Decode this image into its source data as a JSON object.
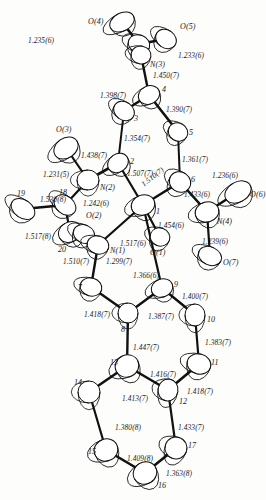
{
  "figure": {
    "type": "ortep-molecular-structure-diagram",
    "title": "",
    "background_color": "#fdfdfc",
    "line_color": "#111111"
  },
  "atoms": [
    {
      "id": "O4",
      "label": "O(4)",
      "x": 122,
      "y": 22,
      "rx": 13,
      "ry": 9,
      "rot": -28,
      "label_dx": -34,
      "label_dy": -4
    },
    {
      "id": "C21",
      "label": "",
      "x": 139,
      "y": 44,
      "rx": 11,
      "ry": 9,
      "rot": 20,
      "label_dx": 0,
      "label_dy": 0
    },
    {
      "id": "O5",
      "label": "O(5)",
      "x": 166,
      "y": 39,
      "rx": 11,
      "ry": 9,
      "rot": 35,
      "label_dx": 14,
      "label_dy": -16
    },
    {
      "id": "N3",
      "label": "N(3)",
      "x": 141,
      "y": 55,
      "rx": 10,
      "ry": 9,
      "rot": 10,
      "label_dx": 9,
      "label_dy": 6
    },
    {
      "id": "C4",
      "label": "4",
      "x": 149,
      "y": 95,
      "rx": 11,
      "ry": 9,
      "rot": -25,
      "label_dx": 13,
      "label_dy": -9
    },
    {
      "id": "C3",
      "label": "3",
      "x": 124,
      "y": 111,
      "rx": 11,
      "ry": 9,
      "rot": 35,
      "label_dx": 10,
      "label_dy": 4
    },
    {
      "id": "C5",
      "label": "5",
      "x": 178,
      "y": 132,
      "rx": 10,
      "ry": 9,
      "rot": 30,
      "label_dx": 11,
      "label_dy": -3
    },
    {
      "id": "C2",
      "label": "2",
      "x": 118,
      "y": 163,
      "rx": 11,
      "ry": 9,
      "rot": -35,
      "label_dx": 12,
      "label_dy": -5
    },
    {
      "id": "O3",
      "label": "O(3)",
      "x": 66,
      "y": 148,
      "rx": 13,
      "ry": 10,
      "rot": -35,
      "label_dx": -10,
      "label_dy": -22
    },
    {
      "id": "N2",
      "label": "N(2)",
      "x": 88,
      "y": 180,
      "rx": 11,
      "ry": 10,
      "rot": 0,
      "label_dx": 12,
      "label_dy": 4
    },
    {
      "id": "C6",
      "label": "6",
      "x": 180,
      "y": 182,
      "rx": 11,
      "ry": 10,
      "rot": 35,
      "label_dx": 11,
      "label_dy": -6
    },
    {
      "id": "C1",
      "label": "1",
      "x": 143,
      "y": 205,
      "rx": 12,
      "ry": 10,
      "rot": -20,
      "label_dx": 13,
      "label_dy": 3
    },
    {
      "id": "C18",
      "label": "18",
      "x": 65,
      "y": 205,
      "rx": 12,
      "ry": 9,
      "rot": 40,
      "label_dx": -6,
      "label_dy": -16
    },
    {
      "id": "C19",
      "label": "19",
      "x": 23,
      "y": 209,
      "rx": 13,
      "ry": 9,
      "rot": 35,
      "label_dx": -6,
      "label_dy": -19
    },
    {
      "id": "C20",
      "label": "20",
      "x": 70,
      "y": 232,
      "rx": 12,
      "ry": 10,
      "rot": -30,
      "label_dx": -12,
      "label_dy": 14
    },
    {
      "id": "O2",
      "label": "O(2)",
      "x": 84,
      "y": 234,
      "rx": 11,
      "ry": 9,
      "rot": 25,
      "label_dx": 2,
      "label_dy": -22
    },
    {
      "id": "N1",
      "label": "N(1)",
      "x": 98,
      "y": 245,
      "rx": 11,
      "ry": 9,
      "rot": 15,
      "label_dx": 12,
      "label_dy": 2
    },
    {
      "id": "O1",
      "label": "O(1)",
      "x": 160,
      "y": 237,
      "rx": 10,
      "ry": 9,
      "rot": 20,
      "label_dx": -10,
      "label_dy": 12
    },
    {
      "id": "N4",
      "label": "N(4)",
      "x": 207,
      "y": 212,
      "rx": 12,
      "ry": 10,
      "rot": -15,
      "label_dx": 10,
      "label_dy": 6
    },
    {
      "id": "O6",
      "label": "O(6)",
      "x": 238,
      "y": 192,
      "rx": 14,
      "ry": 10,
      "rot": -30,
      "label_dx": 12,
      "label_dy": -1
    },
    {
      "id": "O7",
      "label": "O(7)",
      "x": 210,
      "y": 256,
      "rx": 12,
      "ry": 9,
      "rot": 25,
      "label_dx": 13,
      "label_dy": 3
    },
    {
      "id": "C7",
      "label": "7",
      "x": 91,
      "y": 287,
      "rx": 11,
      "ry": 9,
      "rot": 15,
      "label_dx": -13,
      "label_dy": -3
    },
    {
      "id": "C9",
      "label": "9",
      "x": 162,
      "y": 288,
      "rx": 11,
      "ry": 9,
      "rot": -20,
      "label_dx": 12,
      "label_dy": -7
    },
    {
      "id": "C8",
      "label": "8",
      "x": 128,
      "y": 313,
      "rx": 10,
      "ry": 10,
      "rot": 0,
      "label_dx": -7,
      "label_dy": 13
    },
    {
      "id": "C10",
      "label": "10",
      "x": 195,
      "y": 315,
      "rx": 10,
      "ry": 11,
      "rot": 0,
      "label_dx": 12,
      "label_dy": 1
    },
    {
      "id": "C13",
      "label": "13",
      "x": 127,
      "y": 366,
      "rx": 12,
      "ry": 11,
      "rot": -25,
      "label_dx": -17,
      "label_dy": -7
    },
    {
      "id": "C11",
      "label": "11",
      "x": 199,
      "y": 364,
      "rx": 12,
      "ry": 10,
      "rot": 15,
      "label_dx": 12,
      "label_dy": -5
    },
    {
      "id": "C14",
      "label": "14",
      "x": 89,
      "y": 392,
      "rx": 11,
      "ry": 11,
      "rot": 0,
      "label_dx": -15,
      "label_dy": -13
    },
    {
      "id": "C12",
      "label": "12",
      "x": 168,
      "y": 390,
      "rx": 10,
      "ry": 11,
      "rot": 10,
      "label_dx": 11,
      "label_dy": 8
    },
    {
      "id": "C15",
      "label": "15",
      "x": 106,
      "y": 450,
      "rx": 12,
      "ry": 11,
      "rot": -20,
      "label_dx": -18,
      "label_dy": -2
    },
    {
      "id": "C17",
      "label": "17",
      "x": 176,
      "y": 448,
      "rx": 11,
      "ry": 11,
      "rot": 20,
      "label_dx": 12,
      "label_dy": -6
    },
    {
      "id": "C16",
      "label": "16",
      "x": 145,
      "y": 473,
      "rx": 12,
      "ry": 11,
      "rot": -30,
      "label_dx": 13,
      "label_dy": 9
    }
  ],
  "bonds": [
    {
      "from": "O4",
      "to": "C21",
      "width": 2.6
    },
    {
      "from": "C21",
      "to": "O5",
      "width": 2.6
    },
    {
      "from": "C21",
      "to": "N3",
      "width": 2.4
    },
    {
      "from": "N3",
      "to": "C4",
      "width": 2.4
    },
    {
      "from": "C4",
      "to": "C3",
      "width": 2.6
    },
    {
      "from": "C4",
      "to": "C5",
      "width": 2.6
    },
    {
      "from": "C3",
      "to": "C2",
      "width": 2.0
    },
    {
      "from": "C5",
      "to": "C6",
      "width": 2.0
    },
    {
      "from": "C2",
      "to": "N2",
      "width": 2.6
    },
    {
      "from": "C2",
      "to": "C1",
      "width": 2.2
    },
    {
      "from": "N2",
      "to": "O3",
      "width": 2.2
    },
    {
      "from": "N2",
      "to": "C18",
      "width": 2.2
    },
    {
      "from": "C18",
      "to": "C19",
      "width": 2.6
    },
    {
      "from": "C18",
      "to": "C20",
      "width": 2.2
    },
    {
      "from": "C6",
      "to": "C1",
      "width": 2.6
    },
    {
      "from": "C6",
      "to": "N4",
      "width": 2.6
    },
    {
      "from": "N4",
      "to": "O6",
      "width": 2.6
    },
    {
      "from": "N4",
      "to": "O7",
      "width": 2.2
    },
    {
      "from": "C1",
      "to": "O1",
      "width": 2.2
    },
    {
      "from": "C1",
      "to": "N1",
      "width": 2.2
    },
    {
      "from": "C20",
      "to": "N1",
      "width": 2.2
    },
    {
      "from": "N1",
      "to": "C7",
      "width": 2.4
    },
    {
      "from": "C7",
      "to": "C8",
      "width": 2.4
    },
    {
      "from": "C8",
      "to": "C9",
      "width": 2.4
    },
    {
      "from": "C9",
      "to": "C10",
      "width": 2.4
    },
    {
      "from": "C10",
      "to": "C11",
      "width": 2.2
    },
    {
      "from": "C8",
      "to": "C13",
      "width": 2.4
    },
    {
      "from": "C13",
      "to": "C12",
      "width": 2.6
    },
    {
      "from": "C11",
      "to": "C12",
      "width": 2.6
    },
    {
      "from": "C13",
      "to": "C14",
      "width": 2.6
    },
    {
      "from": "C14",
      "to": "C15",
      "width": 2.2
    },
    {
      "from": "C15",
      "to": "C16",
      "width": 2.6
    },
    {
      "from": "C16",
      "to": "C17",
      "width": 2.6
    },
    {
      "from": "C17",
      "to": "C12",
      "width": 2.2
    },
    {
      "from": "C9",
      "to": "C1",
      "width": 2.2
    }
  ],
  "bond_labels": [
    {
      "text": "1.235(6)",
      "x": 28,
      "y": 37,
      "rot": 0
    },
    {
      "text": "1.233(6)",
      "x": 178,
      "y": 52,
      "rot": 0
    },
    {
      "text": "1.450(7)",
      "x": 153,
      "y": 72,
      "rot": 0
    },
    {
      "text": "1.398(7)",
      "x": 100,
      "y": 92,
      "rot": 0
    },
    {
      "text": "1.390(7)",
      "x": 166,
      "y": 106,
      "rot": 0
    },
    {
      "text": "1.354(7)",
      "x": 124,
      "y": 135,
      "rot": 0
    },
    {
      "text": "1.361(7)",
      "x": 182,
      "y": 156,
      "rot": 0
    },
    {
      "text": "1.438(7)",
      "x": 81,
      "y": 152,
      "rot": 0
    },
    {
      "text": "1.231(5)",
      "x": 43,
      "y": 171,
      "rot": 0
    },
    {
      "text": "1.242(6)",
      "x": 83,
      "y": 200,
      "rot": 0
    },
    {
      "text": "1.507(7)",
      "x": 127,
      "y": 170,
      "rot": 0
    },
    {
      "text": "1.510(7)",
      "x": 140,
      "y": 182,
      "rot": -38
    },
    {
      "text": "1.236(6)",
      "x": 212,
      "y": 172,
      "rot": 0
    },
    {
      "text": "1.433(6)",
      "x": 184,
      "y": 191,
      "rot": 0
    },
    {
      "text": "1.239(6)",
      "x": 202,
      "y": 238,
      "rot": 0
    },
    {
      "text": "1.530(8)",
      "x": 40,
      "y": 196,
      "rot": 0
    },
    {
      "text": "1.517(8)",
      "x": 25,
      "y": 233,
      "rot": 0
    },
    {
      "text": "1.517(6)",
      "x": 120,
      "y": 240,
      "rot": 0
    },
    {
      "text": "1.454(6)",
      "x": 158,
      "y": 222,
      "rot": 0
    },
    {
      "text": "1.510(7)",
      "x": 63,
      "y": 258,
      "rot": 0
    },
    {
      "text": "1.299(7)",
      "x": 106,
      "y": 258,
      "rot": 0
    },
    {
      "text": "1.366(6)",
      "x": 133,
      "y": 272,
      "rot": 0
    },
    {
      "text": "1.400(7)",
      "x": 182,
      "y": 293,
      "rot": 0
    },
    {
      "text": "1.418(7)",
      "x": 84,
      "y": 311,
      "rot": 0
    },
    {
      "text": "1.387(7)",
      "x": 148,
      "y": 313,
      "rot": 0
    },
    {
      "text": "1.383(7)",
      "x": 205,
      "y": 339,
      "rot": 0
    },
    {
      "text": "1.447(7)",
      "x": 133,
      "y": 344,
      "rot": 0
    },
    {
      "text": "1.416(7)",
      "x": 150,
      "y": 371,
      "rot": 0
    },
    {
      "text": "1.418(7)",
      "x": 187,
      "y": 388,
      "rot": 0
    },
    {
      "text": "1.413(7)",
      "x": 122,
      "y": 395,
      "rot": 0
    },
    {
      "text": "1.380(8)",
      "x": 115,
      "y": 424,
      "rot": 0
    },
    {
      "text": "1.433(7)",
      "x": 178,
      "y": 424,
      "rot": 0
    },
    {
      "text": "1.409(8)",
      "x": 127,
      "y": 455,
      "rot": 0
    },
    {
      "text": "1.363(8)",
      "x": 166,
      "y": 470,
      "rot": 0
    }
  ]
}
